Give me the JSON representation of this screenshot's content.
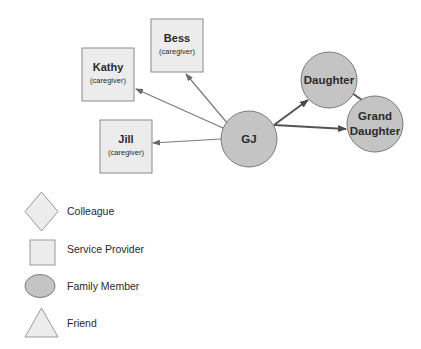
{
  "diagram": {
    "colors": {
      "provider_fill": "#ececec",
      "provider_stroke": "#8a8a8a",
      "family_fill": "#c4c4c4",
      "family_stroke": "#7a7a7a",
      "edge_thin": "#7a7a7a",
      "edge_thick": "#555555"
    },
    "nodes": {
      "bess": {
        "name": "Bess",
        "role": "(caregiver)",
        "type": "Service Provider"
      },
      "kathy": {
        "name": "Kathy",
        "role": "(caregiver)",
        "type": "Service Provider"
      },
      "jill": {
        "name": "Jill",
        "role": "(caregiver)",
        "type": "Service Provider"
      },
      "gj": {
        "name": "GJ",
        "type": "Family Member"
      },
      "daughter": {
        "name": "Daughter",
        "type": "Family Member"
      },
      "granddaughter": {
        "line1": "Grand",
        "line2": "Daughter",
        "type": "Family Member"
      }
    },
    "edges": [
      {
        "from": "GJ",
        "to": "Bess",
        "style": "thin",
        "arrow": true
      },
      {
        "from": "GJ",
        "to": "Kathy",
        "style": "thin",
        "arrow": true
      },
      {
        "from": "GJ",
        "to": "Jill",
        "style": "thin",
        "arrow": true
      },
      {
        "from": "GJ",
        "to": "Daughter",
        "style": "thick",
        "arrow": true
      },
      {
        "from": "GJ",
        "to": "Grand Daughter",
        "style": "thick",
        "arrow": true
      },
      {
        "from": "Daughter",
        "to": "Grand Daughter",
        "style": "thick",
        "arrow": false
      }
    ]
  },
  "legend": {
    "items": [
      {
        "shape": "diamond",
        "label": "Colleague"
      },
      {
        "shape": "square",
        "label": "Service Provider"
      },
      {
        "shape": "ellipse",
        "label": "Family Member"
      },
      {
        "shape": "triangle",
        "label": "Friend"
      }
    ]
  }
}
